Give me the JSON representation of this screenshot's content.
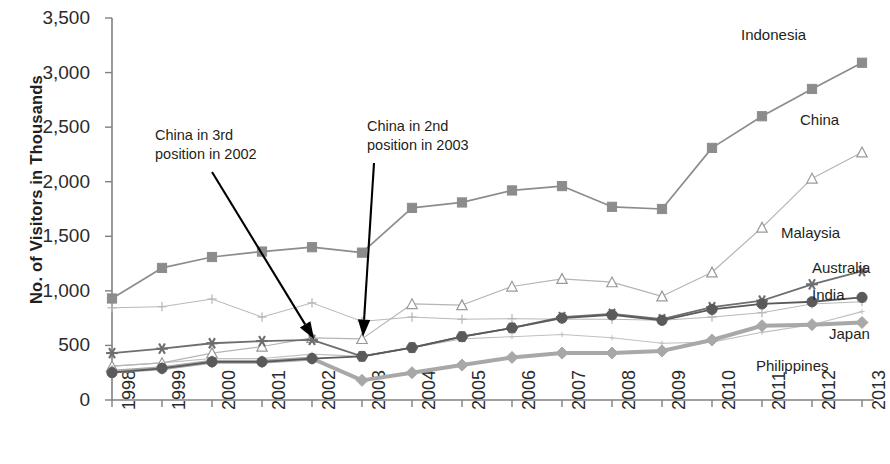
{
  "chart_data": {
    "type": "line",
    "title": "",
    "xlabel": "",
    "ylabel": "No. of Visitors in Thousands",
    "ylim": [
      0,
      3500
    ],
    "ytick_labels": [
      "0",
      "500",
      "1,000",
      "1,500",
      "2,000",
      "2,500",
      "3,000",
      "3,500"
    ],
    "ytick_values": [
      0,
      500,
      1000,
      1500,
      2000,
      2500,
      3000,
      3500
    ],
    "grid": false,
    "legend_position": "right-inline-labels",
    "categories": [
      "1998",
      "1999",
      "2000",
      "2001",
      "2002",
      "2003",
      "2004",
      "2005",
      "2006",
      "2007",
      "2008",
      "2009",
      "2010",
      "2011",
      "2012",
      "2013"
    ],
    "x": [
      1998,
      1999,
      2000,
      2001,
      2002,
      2003,
      2004,
      2005,
      2006,
      2007,
      2008,
      2009,
      2010,
      2011,
      2012,
      2013
    ],
    "series": [
      {
        "name": "Indonesia",
        "marker": "filled-square",
        "color": "#8c8c8c",
        "values": [
          930,
          1210,
          1310,
          1360,
          1400,
          1350,
          1760,
          1810,
          1920,
          1960,
          1770,
          1750,
          2310,
          2600,
          2850,
          3090
        ]
      },
      {
        "name": "China",
        "marker": "open-triangle",
        "color": "#b5b5b5",
        "values": [
          310,
          340,
          430,
          490,
          570,
          560,
          880,
          870,
          1040,
          1110,
          1080,
          950,
          1170,
          1580,
          2030,
          2270
        ]
      },
      {
        "name": "Malaysia",
        "marker": "plus",
        "color": "#b8b8b8",
        "values": [
          845,
          855,
          925,
          760,
          890,
          720,
          760,
          740,
          745,
          740,
          740,
          730,
          760,
          800,
          880,
          900
        ]
      },
      {
        "name": "Australia",
        "marker": "asterisk",
        "color": "#6e6e6e",
        "values": [
          430,
          470,
          520,
          540,
          550,
          400,
          480,
          580,
          660,
          760,
          790,
          740,
          850,
          910,
          1060,
          1180
        ]
      },
      {
        "name": "India",
        "marker": "filled-circle",
        "color": "#5a5a5a",
        "values": [
          250,
          290,
          350,
          350,
          380,
          400,
          480,
          580,
          660,
          750,
          780,
          730,
          830,
          880,
          900,
          940
        ]
      },
      {
        "name": "Japan",
        "marker": "small-dot",
        "color": "#c0c0c0",
        "values": [
          310,
          340,
          380,
          380,
          420,
          400,
          480,
          560,
          580,
          600,
          570,
          520,
          530,
          620,
          690,
          810
        ]
      },
      {
        "name": "Philippines",
        "marker": "filled-diamond",
        "color": "#a8a8a8",
        "values": [
          260,
          290,
          350,
          350,
          380,
          180,
          250,
          320,
          390,
          430,
          430,
          450,
          550,
          680,
          690,
          710
        ]
      }
    ],
    "annotations": [
      {
        "id": "china-3rd-2002",
        "text_lines": [
          "China in 3rd",
          "position in 2002"
        ],
        "points_to_year": 2002,
        "points_to_value": 560
      },
      {
        "id": "china-2nd-2003",
        "text_lines": [
          "China in 2nd",
          "position in 2003"
        ],
        "points_to_year": 2003,
        "points_to_value": 580
      }
    ]
  },
  "series_labels": {
    "indonesia": "Indonesia",
    "china": "China",
    "malaysia": "Malaysia",
    "australia": "Australia",
    "india": "India",
    "japan": "Japan",
    "philippines": "Philippines"
  },
  "axis": {
    "y_title": "No. of Visitors in Thousands"
  }
}
